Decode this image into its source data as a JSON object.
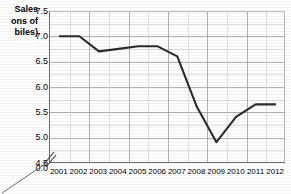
{
  "chart_data": {
    "type": "line",
    "title": "",
    "xlabel": "",
    "ylabel": "Sales\n(Millions of\nAutomobiles)",
    "ylabel_display": "Sales\nons of\nbiles)",
    "categories": [
      "2001",
      "2002",
      "2003",
      "2004",
      "2005",
      "2006",
      "2007",
      "2008",
      "2009",
      "2010",
      "2011",
      "2012"
    ],
    "values": [
      7.0,
      7.0,
      6.7,
      6.75,
      6.8,
      6.8,
      6.6,
      5.6,
      4.9,
      5.4,
      5.65,
      5.65
    ],
    "series": [
      {
        "name": "Sales",
        "values": [
          7.0,
          7.0,
          6.7,
          6.75,
          6.8,
          6.8,
          6.6,
          5.6,
          4.9,
          5.4,
          5.65,
          5.65
        ]
      }
    ],
    "yticks": [
      "7.5",
      "7.0",
      "6.5",
      "6.0",
      "5.5",
      "5.0",
      "4.5",
      "0.0"
    ],
    "ytick_values": [
      7.5,
      7.0,
      6.5,
      6.0,
      5.5,
      5.0,
      4.5,
      0.0
    ],
    "ylim": [
      4.5,
      7.5
    ],
    "axis_break": true,
    "axis_break_label": "0.0",
    "grid": true,
    "legend": "none",
    "line_color": "#2b2b2b",
    "grid_color": "#9a9a9a",
    "minor_grid_color": "#d8d8d8",
    "background_color": "#ffffff",
    "axis_color": "#6e6e6e"
  },
  "ylabel_lines": [
    "Sales",
    "ons of",
    "biles)"
  ]
}
